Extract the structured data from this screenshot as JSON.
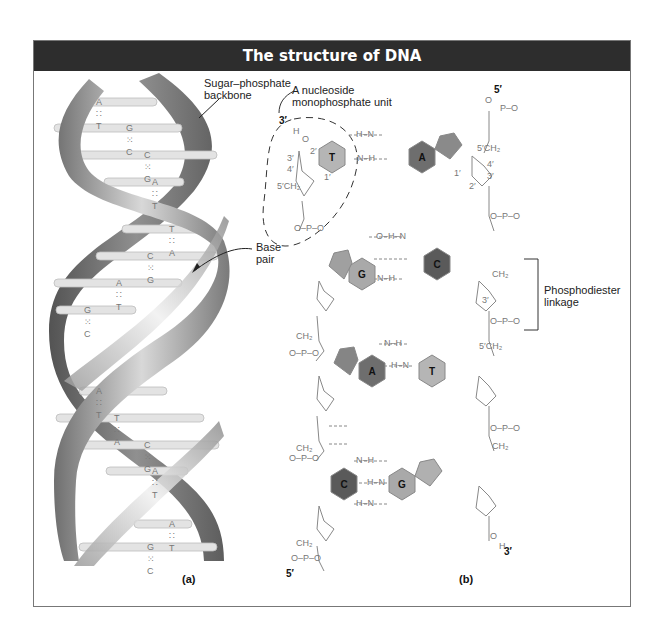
{
  "figure": {
    "title": "The structure of DNA",
    "panels": [
      {
        "id": "a",
        "label": "(a)"
      },
      {
        "id": "b",
        "label": "(b)"
      }
    ]
  },
  "panel_a": {
    "annotations": {
      "backbone": "Sugar–phosphate backbone",
      "backbone_line1": "Sugar–phosphate",
      "backbone_line2": "backbone",
      "base_pair_line1": "Base",
      "base_pair_line2": "pair"
    },
    "base_pairs": [
      {
        "left": "A",
        "bond": ":::",
        "right": "T"
      },
      {
        "left": "G",
        "bond": "::::",
        "right": "C"
      },
      {
        "left": "C",
        "bond": "::::",
        "right": "G"
      },
      {
        "left": "A",
        "bond": ":::",
        "right": "T"
      },
      {
        "left": "T",
        "bond": ":::",
        "right": "A"
      },
      {
        "left": "C",
        "bond": "::::",
        "right": "G"
      },
      {
        "left": "A",
        "bond": ":::",
        "right": "T"
      },
      {
        "left": "G",
        "bond": "::::",
        "right": "C"
      },
      {
        "left": "A",
        "bond": ":::",
        "right": "T"
      },
      {
        "left": "T",
        "bond": ":::",
        "right": "A"
      },
      {
        "left": "C",
        "bond": "::::",
        "right": "G"
      },
      {
        "left": "A",
        "bond": ":::",
        "right": "T"
      },
      {
        "left": "A",
        "bond": ":::",
        "right": "T"
      },
      {
        "left": "G",
        "bond": "::::",
        "right": "C"
      }
    ],
    "bp_text": [
      "A ∷ T",
      "G ⁙ C",
      "C ⁙ G",
      "A ∷ T",
      "T ∷ A",
      "C ⁙ G",
      "A ∷ T",
      "G ⁙ C",
      "A ∷ T",
      "T ∷ A",
      "C ⁙ G",
      "A ∷ T",
      "A ∷ T",
      "G ⁙ C"
    ]
  },
  "panel_b": {
    "annotations": {
      "nucleoside_line1": "A nucleoside",
      "nucleoside_line2": "monophosphate unit",
      "phosphodiester_line1": "Phosphodiester",
      "phosphodiester_line2": "linkage"
    },
    "strand_ends": {
      "left_top": "3′",
      "right_top": "5′",
      "left_bottom": "5′",
      "right_bottom": "3′"
    },
    "base_pairs": [
      {
        "left": "T",
        "right": "A"
      },
      {
        "left": "G",
        "right": "C"
      },
      {
        "left": "A",
        "right": "T"
      },
      {
        "left": "C",
        "right": "G"
      }
    ],
    "carbon_labels": [
      "1′",
      "2′",
      "3′",
      "4′",
      "5′"
    ],
    "atoms": {
      "O": "O",
      "P": "P",
      "H": "H",
      "N": "N",
      "CH2": "CH₂"
    },
    "colors": {
      "T": "#b5b5b5",
      "A": "#6e6e6e",
      "G": "#a9a9a9",
      "C": "#5a5a5a",
      "pentose_purine": "#8a8a8a",
      "bond": "#888888"
    }
  },
  "colors": {
    "title_bg": "#2d2d2d",
    "title_text": "#ffffff",
    "frame_border": "#777777",
    "strand_light": "#b8b8b8",
    "strand_dark": "#5a5a5a",
    "base_bar": "#e2e2e2"
  }
}
